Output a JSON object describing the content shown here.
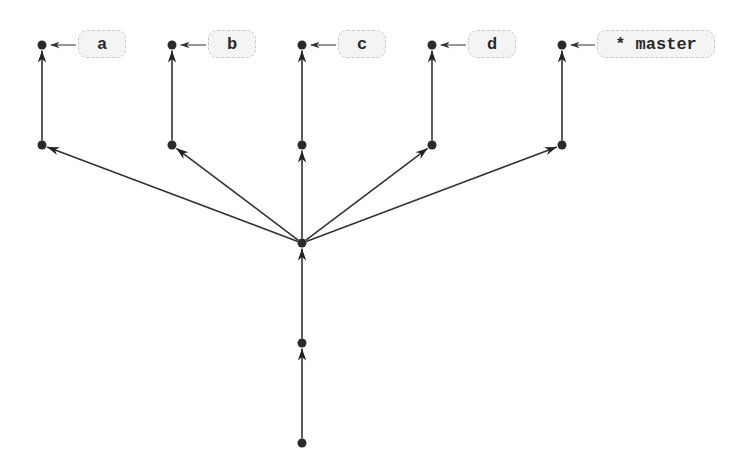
{
  "diagram": {
    "type": "git-commit-graph",
    "colors": {
      "edge": "#333333",
      "node": "#2a2a2a",
      "label_bg": "#f4f4f4",
      "label_border": "#c8c8c8"
    },
    "nodes": [
      {
        "id": "n0",
        "x": 302,
        "y": 443
      },
      {
        "id": "n1",
        "x": 302,
        "y": 343
      },
      {
        "id": "n2",
        "x": 302,
        "y": 243
      },
      {
        "id": "a1",
        "x": 42,
        "y": 145
      },
      {
        "id": "b1",
        "x": 172,
        "y": 145
      },
      {
        "id": "c1",
        "x": 302,
        "y": 145
      },
      {
        "id": "d1",
        "x": 432,
        "y": 145
      },
      {
        "id": "m1",
        "x": 562,
        "y": 145
      },
      {
        "id": "a2",
        "x": 42,
        "y": 45
      },
      {
        "id": "b2",
        "x": 172,
        "y": 45
      },
      {
        "id": "c2",
        "x": 302,
        "y": 45
      },
      {
        "id": "d2",
        "x": 432,
        "y": 45
      },
      {
        "id": "m2",
        "x": 562,
        "y": 45
      }
    ],
    "edges": [
      {
        "from": "n0",
        "to": "n1"
      },
      {
        "from": "n1",
        "to": "n2"
      },
      {
        "from": "n2",
        "to": "a1"
      },
      {
        "from": "n2",
        "to": "b1"
      },
      {
        "from": "n2",
        "to": "c1"
      },
      {
        "from": "n2",
        "to": "d1"
      },
      {
        "from": "n2",
        "to": "m1"
      },
      {
        "from": "a1",
        "to": "a2"
      },
      {
        "from": "b1",
        "to": "b2"
      },
      {
        "from": "c1",
        "to": "c2"
      },
      {
        "from": "d1",
        "to": "d2"
      },
      {
        "from": "m1",
        "to": "m2"
      }
    ],
    "branches": [
      {
        "name": "a",
        "label": "a",
        "target": "a2",
        "x": 78,
        "w": 48
      },
      {
        "name": "b",
        "label": "b",
        "target": "b2",
        "x": 208,
        "w": 48
      },
      {
        "name": "c",
        "label": "c",
        "target": "c2",
        "x": 338,
        "w": 48
      },
      {
        "name": "d",
        "label": "d",
        "target": "d2",
        "x": 468,
        "w": 48
      },
      {
        "name": "master",
        "label": "* master",
        "target": "m2",
        "x": 597,
        "w": 118
      }
    ]
  }
}
